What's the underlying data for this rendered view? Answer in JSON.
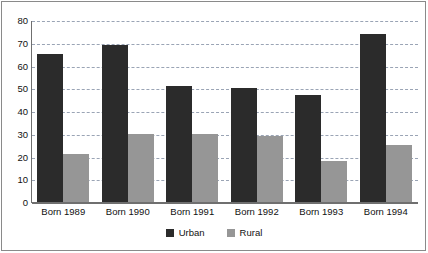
{
  "chart_data": {
    "type": "bar",
    "title": "",
    "subtitle": "",
    "xlabel": "",
    "ylabel": "",
    "categories": [
      "Born 1989",
      "Born 1990",
      "Born 1991",
      "Born 1992",
      "Born 1993",
      "Born 1994"
    ],
    "series": [
      {
        "name": "Urban",
        "color": "#2b2b2b",
        "values": [
          65,
          69,
          51,
          50,
          47,
          74
        ]
      },
      {
        "name": "Rural",
        "color": "#969696",
        "values": [
          21,
          30,
          30,
          29,
          18,
          25
        ]
      }
    ],
    "ylim": [
      0,
      80
    ],
    "yticks": [
      0,
      10,
      20,
      30,
      40,
      50,
      60,
      70,
      80
    ],
    "ytick_labels": [
      "0",
      "10",
      "20",
      "30",
      "40",
      "50",
      "60",
      "70",
      "80"
    ],
    "grid": true,
    "grid_axis": "y",
    "grid_style": "dashed",
    "grid_color": "#9aa4b5",
    "legend": [
      "Urban",
      "Rural"
    ],
    "legend_position": "bottom-center",
    "axis_color": "#6f6f6f",
    "background": "#ffffff"
  }
}
